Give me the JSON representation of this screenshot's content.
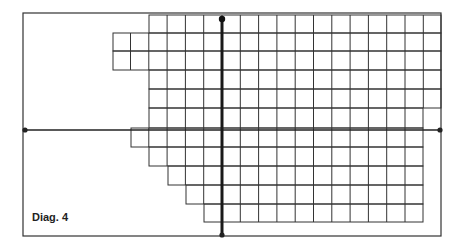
{
  "diagram": {
    "caption": "Diag. 4",
    "colors": {
      "line": "#333333",
      "axis": "#1a1a1a",
      "background": "#ffffff"
    },
    "frame": {
      "x1": 23,
      "y1": 13,
      "x2": 441,
      "y2": 236
    },
    "cell_size": 18.3,
    "grid_rows": [
      {
        "y1": 15,
        "y2": 33,
        "x1": 149,
        "x2": 441
      },
      {
        "y1": 33,
        "y2": 51,
        "x1": 113,
        "x2": 441
      },
      {
        "y1": 51,
        "y2": 70,
        "x1": 113,
        "x2": 441
      },
      {
        "y1": 70,
        "y2": 89,
        "x1": 149,
        "x2": 441
      },
      {
        "y1": 89,
        "y2": 108,
        "x1": 149,
        "x2": 441
      },
      {
        "y1": 108,
        "y2": 128,
        "x1": 149,
        "x2": 423
      },
      {
        "y1": 128,
        "y2": 147,
        "x1": 131,
        "x2": 423
      },
      {
        "y1": 147,
        "y2": 166,
        "x1": 149,
        "x2": 423
      },
      {
        "y1": 166,
        "y2": 185,
        "x1": 168,
        "x2": 423
      },
      {
        "y1": 185,
        "y2": 204,
        "x1": 186,
        "x2": 423
      },
      {
        "y1": 204,
        "y2": 222,
        "x1": 204,
        "x2": 423
      }
    ],
    "axes": {
      "horizontal": {
        "y": 130,
        "x1": 25,
        "x2": 440
      },
      "vertical": {
        "x": 222,
        "y1": 19,
        "y2": 235
      }
    }
  }
}
